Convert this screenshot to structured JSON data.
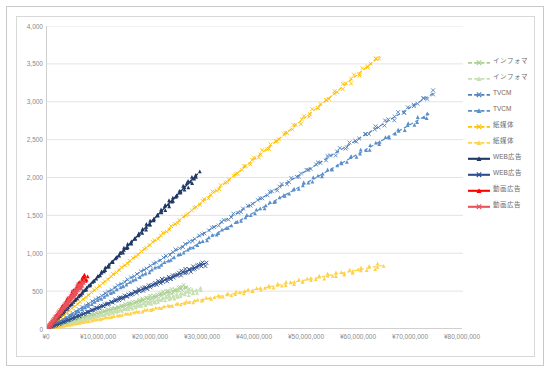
{
  "chart_data": {
    "type": "scatter",
    "title": "",
    "xlabel": "",
    "ylabel": "",
    "xlim": [
      0,
      80000000
    ],
    "ylim": [
      0,
      4000
    ],
    "grid": "horizontal",
    "legend_position": "right",
    "x_ticks": [
      "¥0",
      "¥10,000,000",
      "¥20,000,000",
      "¥30,000,000",
      "¥40,000,000",
      "¥50,000,000",
      "¥60,000,000",
      "¥70,000,000",
      "¥80,000,000"
    ],
    "x_tick_values": [
      0,
      10000000,
      20000000,
      30000000,
      40000000,
      50000000,
      60000000,
      70000000,
      80000000
    ],
    "y_ticks": [
      "0",
      "500",
      "1,000",
      "1,500",
      "2,000",
      "2,500",
      "3,000",
      "3,500",
      "4,000"
    ],
    "y_tick_values": [
      0,
      500,
      1000,
      1500,
      2000,
      2500,
      3000,
      3500,
      4000
    ],
    "series": [
      {
        "name": "インフォマ",
        "color": "#a9d08e",
        "style": "dashed",
        "marker": "x",
        "x_end": 27000000,
        "y_end": 560
      },
      {
        "name": "インフォマ",
        "color": "#c6e0b4",
        "style": "dashed",
        "marker": "triangle",
        "x_end": 29500000,
        "y_end": 520
      },
      {
        "name": "TVCM",
        "color": "#4f81bd",
        "style": "dashed",
        "marker": "x",
        "x_end": 74500000,
        "y_end": 3120
      },
      {
        "name": "TVCM",
        "color": "#5b8fc9",
        "style": "dashed",
        "marker": "triangle",
        "x_end": 73500000,
        "y_end": 2840
      },
      {
        "name": "紙媒体",
        "color": "#ffc000",
        "style": "dashed",
        "marker": "x",
        "x_end": 64000000,
        "y_end": 3600
      },
      {
        "name": "紙媒体",
        "color": "#ffd24d",
        "style": "dashed",
        "marker": "triangle",
        "x_end": 64500000,
        "y_end": 840
      },
      {
        "name": "WEB広告",
        "color": "#1f3864",
        "style": "solid",
        "marker": "triangle",
        "x_end": 29000000,
        "y_end": 2050
      },
      {
        "name": "WEB広告",
        "color": "#2e4f8f",
        "style": "solid",
        "marker": "x",
        "x_end": 30500000,
        "y_end": 870
      },
      {
        "name": "動画広告",
        "color": "#ff0000",
        "style": "solid",
        "marker": "triangle",
        "x_end": 7500000,
        "y_end": 700
      },
      {
        "name": "動画広告",
        "color": "#e8545c",
        "style": "solid",
        "marker": "x",
        "x_end": 7000000,
        "y_end": 620
      }
    ]
  },
  "legend": {
    "items": [
      {
        "label": "インフォマ"
      },
      {
        "label": "インフォマ"
      },
      {
        "label": "TVCM"
      },
      {
        "label": "TVCM"
      },
      {
        "label": "紙媒体"
      },
      {
        "label": "紙媒体"
      },
      {
        "label": "WEB広告"
      },
      {
        "label": "WEB広告"
      },
      {
        "label": "動画広告"
      },
      {
        "label": "動画広告"
      }
    ]
  }
}
